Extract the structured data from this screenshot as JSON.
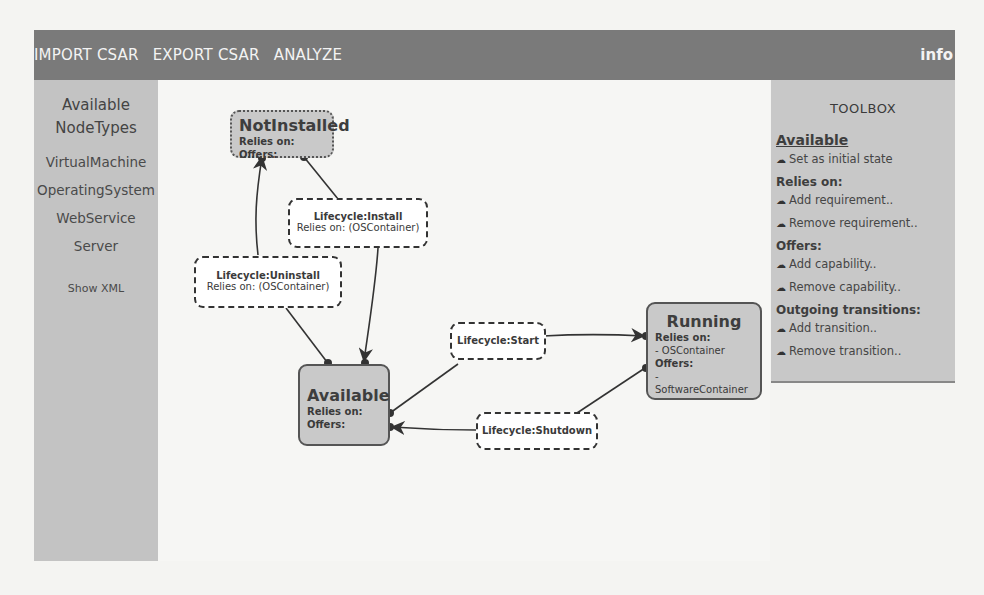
{
  "header": {
    "menu": [
      "IMPORT CSAR",
      "EXPORT CSAR",
      "ANALYZE"
    ],
    "info": "info",
    "background": "#7a7a7a"
  },
  "sidebar": {
    "title_line1": "Available",
    "title_line2": "NodeTypes",
    "types": [
      "VirtualMachine",
      "OperatingSystem",
      "WebService",
      "Server"
    ],
    "show_xml": "Show XML"
  },
  "toolbox": {
    "title": "TOOLBOX",
    "selected_state": "Available",
    "set_initial": "Set as initial state",
    "relies_on_head": "Relies on:",
    "add_requirement": "Add requirement..",
    "remove_requirement": "Remove requirement..",
    "offers_head": "Offers:",
    "add_capability": "Add capability..",
    "remove_capability": "Remove capability..",
    "transitions_head": "Outgoing transitions:",
    "add_transition": "Add transition..",
    "remove_transition": "Remove transition..",
    "icon": "cloud-icon"
  },
  "states": {
    "notinstalled": {
      "name": "NotInstalled",
      "relies_label": "Relies on:",
      "offers_label": "Offers:"
    },
    "available": {
      "name": "Available",
      "relies_label": "Relies on:",
      "offers_label": "Offers:"
    },
    "running": {
      "name": "Running",
      "relies_label": "Relies on:",
      "relies_value": "- OSContainer",
      "offers_label": "Offers:",
      "offers_value": "- SoftwareContainer"
    }
  },
  "transitions": {
    "install": {
      "name": "Lifecycle:Install",
      "sub": "Relies on: (OSContainer)"
    },
    "uninstall": {
      "name": "Lifecycle:Uninstall",
      "sub": "Relies on: (OSContainer)"
    },
    "start": {
      "name": "Lifecycle:Start"
    },
    "shutdown": {
      "name": "Lifecycle:Shutdown"
    }
  }
}
